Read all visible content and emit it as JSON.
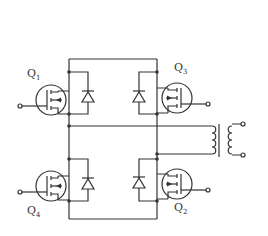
{
  "diagram": {
    "type": "full-bridge MOSFET inverter with output transformer",
    "transistors": [
      {
        "id": "Q1",
        "label": "Q",
        "sub": "1",
        "position": "top-left"
      },
      {
        "id": "Q3",
        "label": "Q",
        "sub": "3",
        "position": "top-right"
      },
      {
        "id": "Q4",
        "label": "Q",
        "sub": "4",
        "position": "bottom-left"
      },
      {
        "id": "Q2",
        "label": "Q",
        "sub": "2",
        "position": "bottom-right"
      }
    ],
    "components": [
      "4 N-channel MOSFETs",
      "4 anti-parallel diodes",
      "1 transformer"
    ],
    "colors": {
      "line": "#333333",
      "background": "#ffffff"
    }
  }
}
